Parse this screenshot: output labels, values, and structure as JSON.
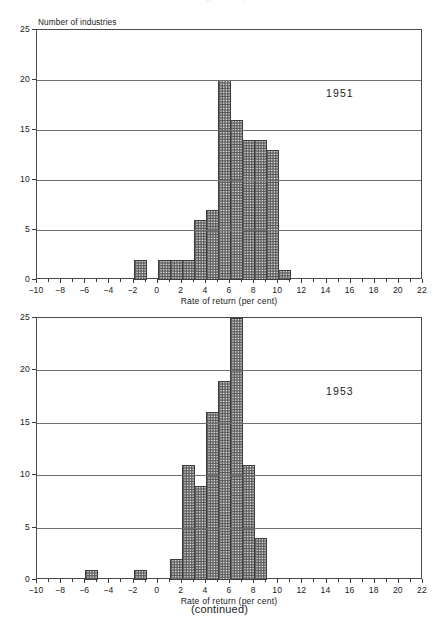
{
  "ghost_text": "Rate of return (per cent)",
  "footnote": "(continued)",
  "axes": {
    "y_axis_title": "Number of industries",
    "y_ticks": [
      "0",
      "5",
      "10",
      "15",
      "20",
      "25"
    ],
    "x_axis_title": "Rate of return (per cent)",
    "x_ticks": [
      "-10",
      "-8",
      "-6",
      "-4",
      "-2",
      "0",
      "2",
      "4",
      "6",
      "8",
      "10",
      "12",
      "14",
      "16",
      "18",
      "20",
      "22"
    ]
  },
  "charts": [
    {
      "annotation": "1951",
      "y_axis_title": "Number of industries",
      "x_axis_title": "Rate of return (per cent)"
    },
    {
      "annotation": "1953",
      "y_axis_title": "",
      "x_axis_title": "Rate of return (per cent)"
    }
  ],
  "chart_data": [
    {
      "type": "bar",
      "title": "",
      "annotation": "1951",
      "xlabel": "Rate of return (per cent)",
      "ylabel": "Number of industries",
      "xlim": [
        -10,
        22
      ],
      "ylim": [
        0,
        25
      ],
      "xticks": [
        -10,
        -8,
        -6,
        -4,
        -2,
        0,
        2,
        4,
        6,
        8,
        10,
        12,
        14,
        16,
        18,
        20,
        22
      ],
      "yticks": [
        0,
        5,
        10,
        15,
        20,
        25
      ],
      "grid": "horizontal",
      "legend": "none",
      "bin_width": 1,
      "bins": [
        {
          "x0": -2,
          "x1": -1,
          "value": 2
        },
        {
          "x0": 0,
          "x1": 1,
          "value": 2
        },
        {
          "x0": 1,
          "x1": 2,
          "value": 2
        },
        {
          "x0": 2,
          "x1": 3,
          "value": 2
        },
        {
          "x0": 3,
          "x1": 4,
          "value": 6
        },
        {
          "x0": 4,
          "x1": 5,
          "value": 7
        },
        {
          "x0": 5,
          "x1": 6,
          "value": 20
        },
        {
          "x0": 6,
          "x1": 7,
          "value": 16
        },
        {
          "x0": 7,
          "x1": 8,
          "value": 14
        },
        {
          "x0": 8,
          "x1": 9,
          "value": 14
        },
        {
          "x0": 9,
          "x1": 10,
          "value": 13
        },
        {
          "x0": 10,
          "x1": 11,
          "value": 1
        }
      ]
    },
    {
      "type": "bar",
      "title": "",
      "annotation": "1953",
      "xlabel": "Rate of return (per cent)",
      "ylabel": "Number of industries",
      "xlim": [
        -10,
        22
      ],
      "ylim": [
        0,
        25
      ],
      "xticks": [
        -10,
        -8,
        -6,
        -4,
        -2,
        0,
        2,
        4,
        6,
        8,
        10,
        12,
        14,
        16,
        18,
        20,
        22
      ],
      "yticks": [
        0,
        5,
        10,
        15,
        20,
        25
      ],
      "grid": "horizontal",
      "legend": "none",
      "bin_width": 1,
      "bins": [
        {
          "x0": -6,
          "x1": -5,
          "value": 1
        },
        {
          "x0": -2,
          "x1": -1,
          "value": 1
        },
        {
          "x0": 1,
          "x1": 2,
          "value": 2
        },
        {
          "x0": 2,
          "x1": 3,
          "value": 11
        },
        {
          "x0": 3,
          "x1": 4,
          "value": 9
        },
        {
          "x0": 4,
          "x1": 5,
          "value": 16
        },
        {
          "x0": 5,
          "x1": 6,
          "value": 19
        },
        {
          "x0": 6,
          "x1": 7,
          "value": 25
        },
        {
          "x0": 7,
          "x1": 8,
          "value": 11
        },
        {
          "x0": 8,
          "x1": 9,
          "value": 4
        }
      ]
    }
  ]
}
